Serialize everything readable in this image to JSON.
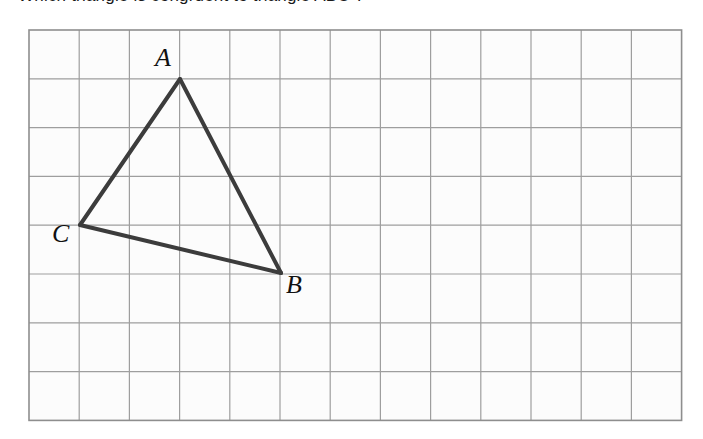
{
  "heading": {
    "clipped_text": "Which triangle is congruent to triangle ABC ?"
  },
  "figure": {
    "name": "triangle-on-grid",
    "background_color": "#ffffff",
    "cell_fill": "#fcfcfc",
    "grid_line_color": "#9e9e9e",
    "grid_border_color": "#8e8e8e",
    "triangle_stroke_color": "#3c3c3c",
    "triangle_stroke_width": 4,
    "grid": {
      "origin_x": 29,
      "origin_y": 30,
      "columns": 13,
      "rows": 8,
      "cell_width": 50.2,
      "cell_height": 48.8
    },
    "vertices": [
      {
        "label": "A",
        "grid_x": 3,
        "grid_y": 1,
        "px_x": 180,
        "px_y": 79,
        "label_px_x": 155,
        "label_px_y": 45
      },
      {
        "label": "B",
        "grid_x": 5,
        "grid_y": 5,
        "px_x": 281,
        "px_y": 273,
        "label_px_x": 286,
        "label_px_y": 272
      },
      {
        "label": "C",
        "grid_x": 1,
        "grid_y": 4,
        "px_x": 80,
        "px_y": 225,
        "label_px_x": 52,
        "label_px_y": 221
      }
    ],
    "edges": [
      {
        "from": "A",
        "to": "B"
      },
      {
        "from": "B",
        "to": "C"
      },
      {
        "from": "C",
        "to": "A"
      }
    ]
  }
}
